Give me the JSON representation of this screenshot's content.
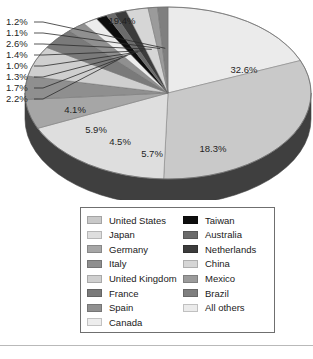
{
  "chart_data": {
    "type": "pie",
    "title": "",
    "subtitle": "",
    "xlabel": "",
    "ylabel": "",
    "units": "percent",
    "legend_position": "bottom",
    "grid": false,
    "three_d": true,
    "categories": [
      "United States",
      "Japan",
      "Germany",
      "Italy",
      "United Kingdom",
      "France",
      "Spain",
      "Canada",
      "Taiwan",
      "Australia",
      "Netherlands",
      "China",
      "Mexico",
      "Brazil",
      "All others"
    ],
    "values": [
      32.6,
      18.3,
      5.7,
      4.5,
      5.9,
      4.1,
      2.2,
      1.7,
      1.3,
      1.0,
      1.4,
      2.6,
      1.1,
      1.2,
      19.4
    ],
    "slices": [
      {
        "label": "All others",
        "value": 19.4,
        "display": "19.4%",
        "color": "#ebebeb"
      },
      {
        "label": "United States",
        "value": 32.6,
        "display": "32.6%",
        "color": "#c9c9c9"
      },
      {
        "label": "Japan",
        "value": 18.3,
        "display": "18.3%",
        "color": "#dedede"
      },
      {
        "label": "Germany",
        "value": 5.7,
        "display": "5.7%",
        "color": "#a6a6a6"
      },
      {
        "label": "Italy",
        "value": 4.5,
        "display": "4.5%",
        "color": "#8f8f8f"
      },
      {
        "label": "United Kingdom",
        "value": 5.9,
        "display": "5.9%",
        "color": "#cfcfcf"
      },
      {
        "label": "France",
        "value": 4.1,
        "display": "4.1%",
        "color": "#7a7a7a"
      },
      {
        "label": "Spain",
        "value": 2.2,
        "display": "2.2%",
        "color": "#909090"
      },
      {
        "label": "Canada",
        "value": 1.7,
        "display": "1.7%",
        "color": "#ededed"
      },
      {
        "label": "Taiwan",
        "value": 1.3,
        "display": "1.3%",
        "color": "#0d0d0d"
      },
      {
        "label": "Australia",
        "value": 1.0,
        "display": "1.0%",
        "color": "#6b6b6b"
      },
      {
        "label": "Netherlands",
        "value": 1.4,
        "display": "1.4%",
        "color": "#3c3c3c"
      },
      {
        "label": "China",
        "value": 2.6,
        "display": "2.6%",
        "color": "#d6d6d6"
      },
      {
        "label": "Mexico",
        "value": 1.1,
        "display": "1.1%",
        "color": "#9b9b9b"
      },
      {
        "label": "Brazil",
        "value": 1.2,
        "display": "1.2%",
        "color": "#7f7f7f"
      }
    ],
    "inner_labels": [
      {
        "text": "19.4%",
        "x": 122,
        "y": 24
      },
      {
        "text": "32.6%",
        "x": 244,
        "y": 73
      },
      {
        "text": "18.3%",
        "x": 213,
        "y": 152
      },
      {
        "text": "5.7%",
        "x": 152,
        "y": 157
      },
      {
        "text": "4.5%",
        "x": 120,
        "y": 145
      },
      {
        "text": "5.9%",
        "x": 96,
        "y": 133
      },
      {
        "text": "4.1%",
        "x": 75,
        "y": 113
      }
    ],
    "callout_labels": [
      {
        "text": "1.2%",
        "x": 6,
        "y": 25
      },
      {
        "text": "1.1%",
        "x": 6,
        "y": 36
      },
      {
        "text": "2.6%",
        "x": 6,
        "y": 47
      },
      {
        "text": "1.4%",
        "x": 6,
        "y": 58
      },
      {
        "text": "1.0%",
        "x": 6,
        "y": 69
      },
      {
        "text": "1.3%",
        "x": 6,
        "y": 80
      },
      {
        "text": "1.7%",
        "x": 6,
        "y": 91
      },
      {
        "text": "2.2%",
        "x": 6,
        "y": 102
      }
    ]
  },
  "legend": {
    "columns": [
      {
        "items": [
          {
            "label": "United States",
            "color": "#c9c9c9"
          },
          {
            "label": "Japan",
            "color": "#dedede"
          },
          {
            "label": "Germany",
            "color": "#a6a6a6"
          },
          {
            "label": "Italy",
            "color": "#8f8f8f"
          },
          {
            "label": "United Kingdom",
            "color": "#cfcfcf"
          },
          {
            "label": "France",
            "color": "#7a7a7a"
          },
          {
            "label": "Spain",
            "color": "#909090"
          },
          {
            "label": "Canada",
            "color": "#ededed"
          }
        ]
      },
      {
        "items": [
          {
            "label": "Taiwan",
            "color": "#0d0d0d"
          },
          {
            "label": "Australia",
            "color": "#6b6b6b"
          },
          {
            "label": "Netherlands",
            "color": "#3c3c3c"
          },
          {
            "label": "China",
            "color": "#d6d6d6"
          },
          {
            "label": "Mexico",
            "color": "#9b9b9b"
          },
          {
            "label": "Brazil",
            "color": "#7f7f7f"
          },
          {
            "label": "All others",
            "color": "#ebebeb"
          }
        ]
      }
    ]
  },
  "style": {
    "pie_center_x": 168,
    "pie_center_y": 93,
    "pie_rx": 143,
    "pie_ry": 86,
    "pie_depth": 26,
    "side_color": "#3f3f3f",
    "edge_color": "#6e6e6e",
    "background": "#ffffff",
    "legend_border": "#6f6f6f",
    "footer_rule": "#b9b9b9"
  }
}
